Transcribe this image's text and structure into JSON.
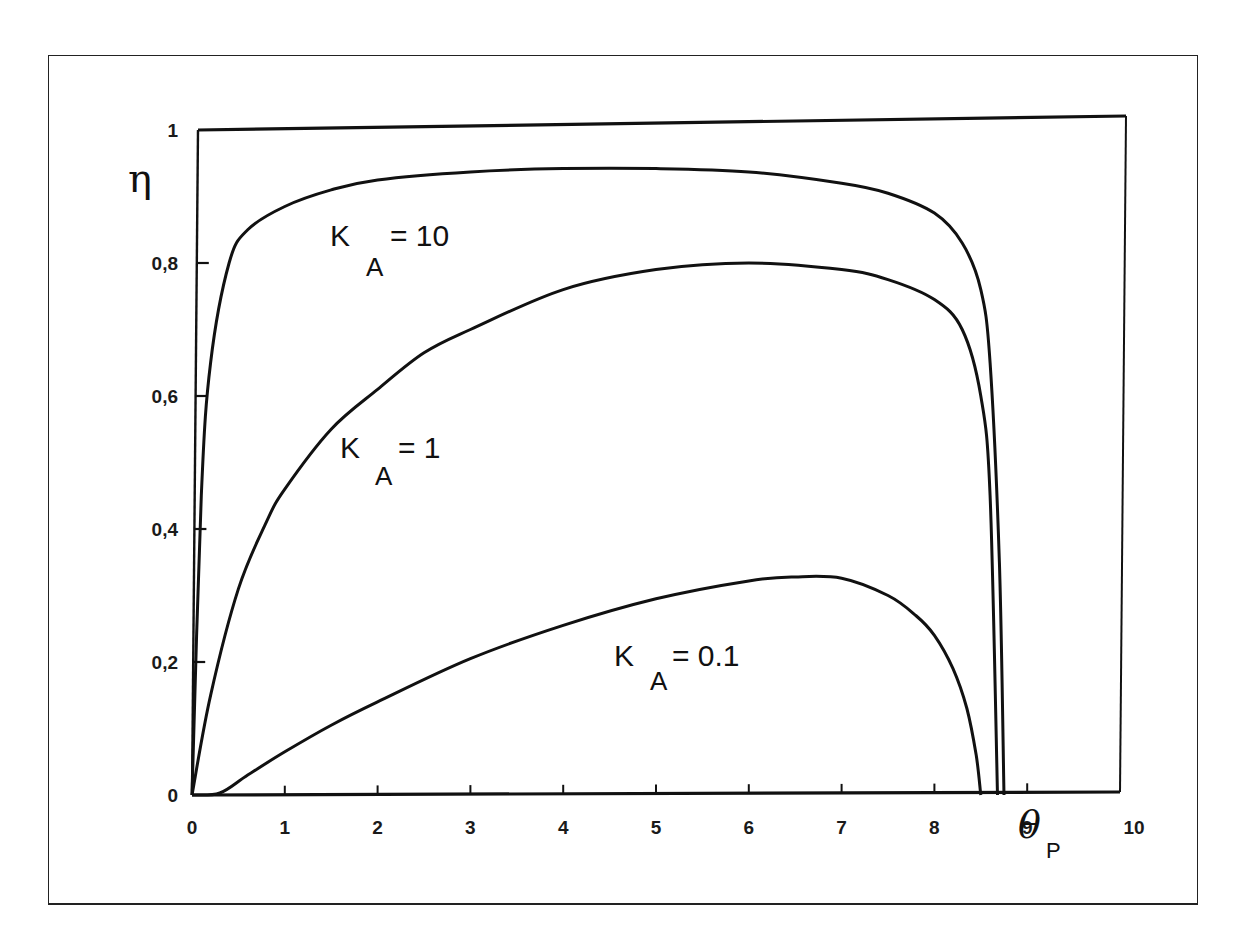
{
  "chart_data": {
    "type": "line",
    "title": "",
    "xlabel": "θP",
    "ylabel": "η",
    "xlim": [
      0,
      10
    ],
    "ylim": [
      0,
      1
    ],
    "grid": false,
    "legend": "inline annotations",
    "x_ticks": [
      "0",
      "1",
      "2",
      "3",
      "4",
      "5",
      "6",
      "7",
      "8",
      "9",
      "10"
    ],
    "y_ticks": [
      "0",
      "0,2",
      "0,4",
      "0,6",
      "0,8",
      "1"
    ],
    "series": [
      {
        "name": "K_A = 10",
        "label_main": "K",
        "label_sub": "A",
        "label_value": "= 10",
        "x": [
          0,
          0.1,
          0.2,
          0.4,
          0.6,
          1.0,
          1.5,
          2.0,
          3.0,
          4.0,
          5.0,
          6.0,
          7.0,
          7.5,
          8.0,
          8.3,
          8.5,
          8.6,
          8.7,
          8.75
        ],
        "y": [
          0,
          0.45,
          0.65,
          0.8,
          0.85,
          0.885,
          0.91,
          0.925,
          0.937,
          0.942,
          0.942,
          0.937,
          0.92,
          0.905,
          0.875,
          0.83,
          0.76,
          0.65,
          0.35,
          0
        ]
      },
      {
        "name": "K_A = 1",
        "label_main": "K",
        "label_sub": "A",
        "label_value": "= 1",
        "x": [
          0,
          0.2,
          0.5,
          0.8,
          1.0,
          1.5,
          2.0,
          2.5,
          3.0,
          4.0,
          5.0,
          6.0,
          7.0,
          7.5,
          8.0,
          8.3,
          8.5,
          8.6,
          8.68
        ],
        "y": [
          0,
          0.15,
          0.31,
          0.41,
          0.46,
          0.55,
          0.61,
          0.665,
          0.7,
          0.76,
          0.79,
          0.8,
          0.79,
          0.775,
          0.745,
          0.7,
          0.6,
          0.45,
          0
        ]
      },
      {
        "name": "K_A = 0.1",
        "label_main": "K",
        "label_sub": "A",
        "label_value": "= 0.1",
        "x": [
          0,
          0.3,
          0.6,
          1.0,
          1.5,
          2.0,
          3.0,
          4.0,
          5.0,
          6.0,
          6.5,
          7.0,
          7.5,
          7.8,
          8.0,
          8.2,
          8.35,
          8.45,
          8.5
        ],
        "y": [
          0,
          0.003,
          0.03,
          0.065,
          0.105,
          0.14,
          0.205,
          0.255,
          0.295,
          0.322,
          0.328,
          0.326,
          0.3,
          0.27,
          0.24,
          0.19,
          0.13,
          0.06,
          0
        ]
      }
    ],
    "reference_line": {
      "name": "η = 1",
      "y": 1
    }
  }
}
